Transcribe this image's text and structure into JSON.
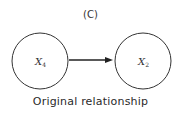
{
  "diagram": {
    "panel_label": "(C)",
    "caption": "Original relationship",
    "nodes": [
      {
        "id": "x4",
        "var": "X",
        "subscript": "4"
      },
      {
        "id": "x2",
        "var": "X",
        "subscript": "2"
      }
    ],
    "edges": [
      {
        "from": "x4",
        "to": "x2",
        "directed": true
      }
    ]
  }
}
